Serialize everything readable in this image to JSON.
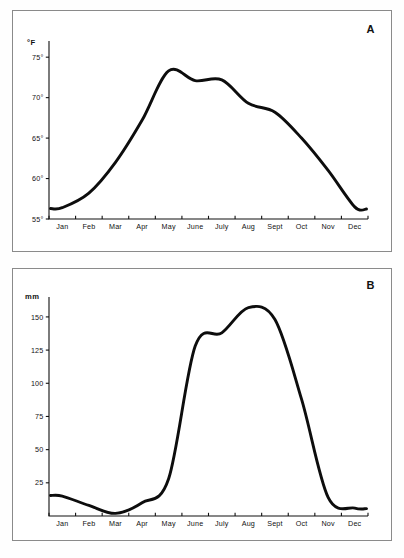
{
  "figure": {
    "panels": [
      {
        "letter": "A",
        "unit_label": "°F",
        "y_ticks": [
          "75°",
          "70°",
          "65°",
          "60°",
          "55°"
        ],
        "x_ticks": [
          "Jan",
          "Feb",
          "Mar",
          "Apr",
          "May",
          "June",
          "July",
          "Aug",
          "Sept",
          "Oct",
          "Nov",
          "Dec"
        ]
      },
      {
        "letter": "B",
        "unit_label": "mm",
        "y_ticks": [
          "150",
          "125",
          "100",
          "75",
          "50",
          "25"
        ],
        "x_ticks": [
          "Jan",
          "Feb",
          "Mar",
          "Apr",
          "May",
          "June",
          "July",
          "Aug",
          "Sept",
          "Oct",
          "Nov",
          "Dec"
        ]
      }
    ]
  },
  "colors": {
    "curve": "#0d0d0d",
    "axis": "#111111",
    "panel_border": "#8a8a8a",
    "background": "#ffffff"
  },
  "chart_data": [
    {
      "type": "line",
      "panel": "A",
      "title": "",
      "xlabel": "",
      "ylabel": "°F",
      "categories": [
        "Jan",
        "Feb",
        "Mar",
        "Apr",
        "May",
        "June",
        "July",
        "Aug",
        "Sept",
        "Oct",
        "Nov",
        "Dec"
      ],
      "values": [
        56.4,
        58.2,
        62.0,
        67.2,
        73.3,
        72.1,
        72.2,
        69.3,
        68.2,
        65.0,
        61.0,
        56.5
      ],
      "series": [
        {
          "name": "Mean monthly temperature",
          "values": [
            56.4,
            58.2,
            62.0,
            67.2,
            73.3,
            72.1,
            72.2,
            69.3,
            68.2,
            65.0,
            61.0,
            56.5
          ]
        }
      ],
      "ylim": [
        55,
        77
      ],
      "ytick_values": [
        75,
        70,
        65,
        60,
        55
      ],
      "ytick_labels": [
        "75°",
        "70°",
        "65°",
        "60°",
        "55°"
      ],
      "grid": false,
      "legend": "none",
      "annotations": [
        "A"
      ]
    },
    {
      "type": "line",
      "panel": "B",
      "title": "",
      "xlabel": "",
      "ylabel": "mm",
      "categories": [
        "Jan",
        "Feb",
        "Mar",
        "Apr",
        "May",
        "June",
        "July",
        "Aug",
        "Sept",
        "Oct",
        "Nov",
        "Dec"
      ],
      "values": [
        15,
        8,
        2,
        10,
        28,
        128,
        138,
        157,
        148,
        88,
        14,
        6
      ],
      "series": [
        {
          "name": "Mean monthly precipitation",
          "values": [
            15,
            8,
            2,
            10,
            28,
            128,
            138,
            157,
            148,
            88,
            14,
            6
          ]
        }
      ],
      "ylim": [
        0,
        165
      ],
      "ytick_values": [
        150,
        125,
        100,
        75,
        50,
        25
      ],
      "ytick_labels": [
        "150",
        "125",
        "100",
        "75",
        "50",
        "25"
      ],
      "grid": false,
      "legend": "none",
      "annotations": [
        "B"
      ]
    }
  ]
}
